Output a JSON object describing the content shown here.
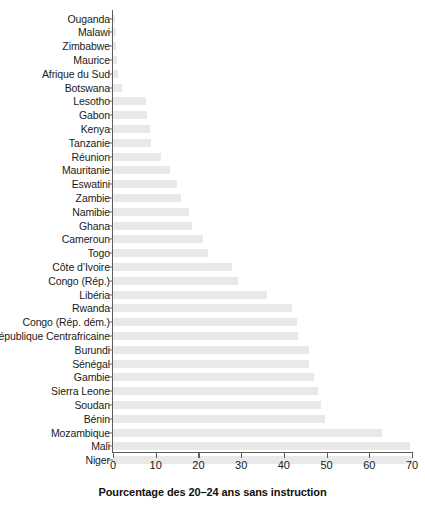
{
  "chart_data": {
    "type": "bar",
    "orientation": "horizontal",
    "title": "",
    "subtitle": "",
    "xlabel": "Pourcentage des 20–24 ans sans instruction",
    "ylabel": "",
    "xlim": [
      0,
      70
    ],
    "xticks": [
      0,
      10,
      20,
      30,
      40,
      50,
      60,
      70
    ],
    "xtick_labels": [
      "0",
      "10",
      "20",
      "30",
      "40",
      "50",
      "60",
      "70"
    ],
    "grid": false,
    "legend": null,
    "bar_color": "#e9e9e9",
    "axis_color": "#5d5d5d",
    "categories": [
      "Ouganda",
      "Malawi",
      "Zimbabwe",
      "Maurice",
      "Afrique du Sud",
      "Botswana",
      "Lesotho",
      "Gabon",
      "Kenya",
      "Tanzanie",
      "Réunion",
      "Mauritanie",
      "Eswatini",
      "Zambie",
      "Namibie",
      "Ghana",
      "Cameroun",
      "Togo",
      "Côte d’Ivoire",
      "Congo (Rép.)",
      "Libéria",
      "Rwanda",
      "Congo (Rép. dém.)",
      "République Centrafricaine",
      "Burundi",
      "Sénégal",
      "Gambie",
      "Sierra Leone",
      "Soudan",
      "Bénin",
      "Mozambique",
      "Mali",
      "Niger"
    ],
    "values": [
      0.4,
      0.6,
      0.8,
      1.0,
      1.2,
      2.0,
      7.8,
      8.0,
      8.6,
      9.0,
      11.2,
      13.4,
      15.0,
      16.0,
      17.8,
      18.6,
      21.0,
      22.2,
      27.8,
      29.2,
      36.0,
      41.8,
      43.0,
      43.4,
      45.8,
      46.0,
      47.0,
      48.0,
      48.8,
      49.6,
      63.0,
      69.6,
      70.0
    ]
  }
}
